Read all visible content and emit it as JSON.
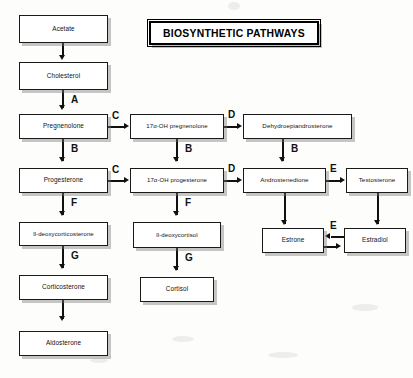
{
  "figure": {
    "title": "BIOSYNTHETIC PATHWAYS",
    "type": "flow-diagram"
  },
  "nodes": {
    "acetate": "Acetate",
    "cholesterol": "Cholesterol",
    "pregnenolone": "Pregnenolone",
    "oh_pregnenolone": "17α-OH pregnenolone",
    "dhea": "Dehydroepiandrosterone",
    "progesterone": "Progesterone",
    "oh_progesterone": "17α-OH progesterone",
    "androstenedione": "Androstenedione",
    "testosterone": "Testosterone",
    "deoxycorticosterone": "ll-deoxycorticosterone",
    "deoxycortisol": "ll-deoxycortisol",
    "estrone": "Estrone",
    "estradiol": "Estradiol",
    "corticosterone": "Corticosterone",
    "cortisol": "Cortisol",
    "aldosterone": "Aldosterone"
  },
  "enzymes": {
    "a": "A",
    "b1": "B",
    "b2": "B",
    "b3": "B",
    "b4": "B",
    "c1": "C",
    "c2": "C",
    "d1": "D",
    "d2": "D",
    "e1": "E",
    "e2": "E",
    "f1": "F",
    "f2": "F",
    "g1": "G",
    "g2": "G"
  },
  "colors": {
    "line": "#111111",
    "box_border": "#1a1a1a",
    "box_fill": "#ffffff",
    "page": "#fdfdfb",
    "shadow": "rgba(120,120,120,0.42)"
  }
}
